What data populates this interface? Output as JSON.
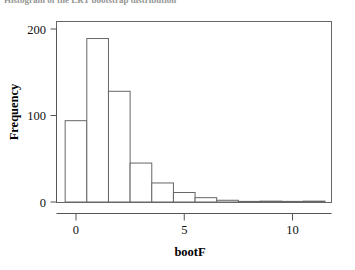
{
  "caption": {
    "text": "Histogram of the LRT bootstrap distribution"
  },
  "chart_data": {
    "type": "bar",
    "title": "",
    "subtitle": "",
    "xlabel": "bootF",
    "ylabel": "Frequency",
    "grid": false,
    "legend": null,
    "xlim": [
      -0.9,
      11.8
    ],
    "ylim": [
      0,
      205
    ],
    "xticks": [
      0,
      5,
      10
    ],
    "xtick_labels": [
      "0",
      "5",
      "10"
    ],
    "yticks": [
      0,
      100,
      200
    ],
    "ytick_labels": [
      "0",
      "100",
      "200"
    ],
    "bin_width": 1,
    "bin_edges": [
      -0.5,
      0.5,
      1.5,
      2.5,
      3.5,
      4.5,
      5.5,
      6.5,
      7.5,
      8.5,
      9.5,
      10.5,
      11.5
    ],
    "bin_centers": [
      0,
      1,
      2,
      3,
      4,
      5,
      6,
      7,
      8,
      9,
      10,
      11
    ],
    "categories": [
      "-0.5 to 0.5",
      "0.5 to 1.5",
      "1.5 to 2.5",
      "2.5 to 3.5",
      "3.5 to 4.5",
      "4.5 to 5.5",
      "5.5 to 6.5",
      "6.5 to 7.5",
      "7.5 to 8.5",
      "8.5 to 9.5",
      "9.5 to 10.5",
      "10.5 to 11.5"
    ],
    "values": [
      94,
      189,
      128,
      45,
      22,
      11,
      5,
      2,
      0,
      1,
      0,
      1
    ],
    "bar_fill": "#ffffff",
    "bar_stroke": "#666666",
    "frame_color": "#666666",
    "axis_color": "#555555",
    "text_color": "#111111"
  }
}
